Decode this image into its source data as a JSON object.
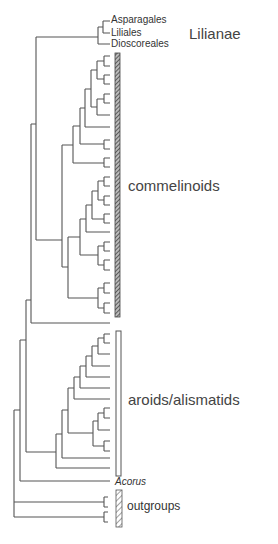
{
  "diagram": {
    "type": "cladogram",
    "taxa_labels": {
      "asparagales": "Asparagales",
      "liliales": "Liliales",
      "dioscoreales": "Dioscoreales",
      "acorus": "Acorus"
    },
    "group_labels": {
      "lilianae": "Lilianae",
      "commelinoids": "commelinoids",
      "aroids": "aroids/alismatids",
      "outgroups": "outgroups"
    },
    "groups": [
      {
        "name": "Lilianae",
        "members": [
          "Asparagales",
          "Liliales",
          "Dioscoreales"
        ]
      },
      {
        "name": "commelinoids",
        "bar": "hatched-dark",
        "leaf_count": 26
      },
      {
        "name": "aroids/alismatids",
        "bar": "open",
        "leaf_count": 13
      },
      {
        "name": "Acorus",
        "leaf_count": 1
      },
      {
        "name": "outgroups",
        "bar": "hatched-light",
        "leaf_count": 4
      }
    ],
    "colors": {
      "line": "#555555",
      "text": "#333333",
      "background": "#ffffff"
    }
  }
}
